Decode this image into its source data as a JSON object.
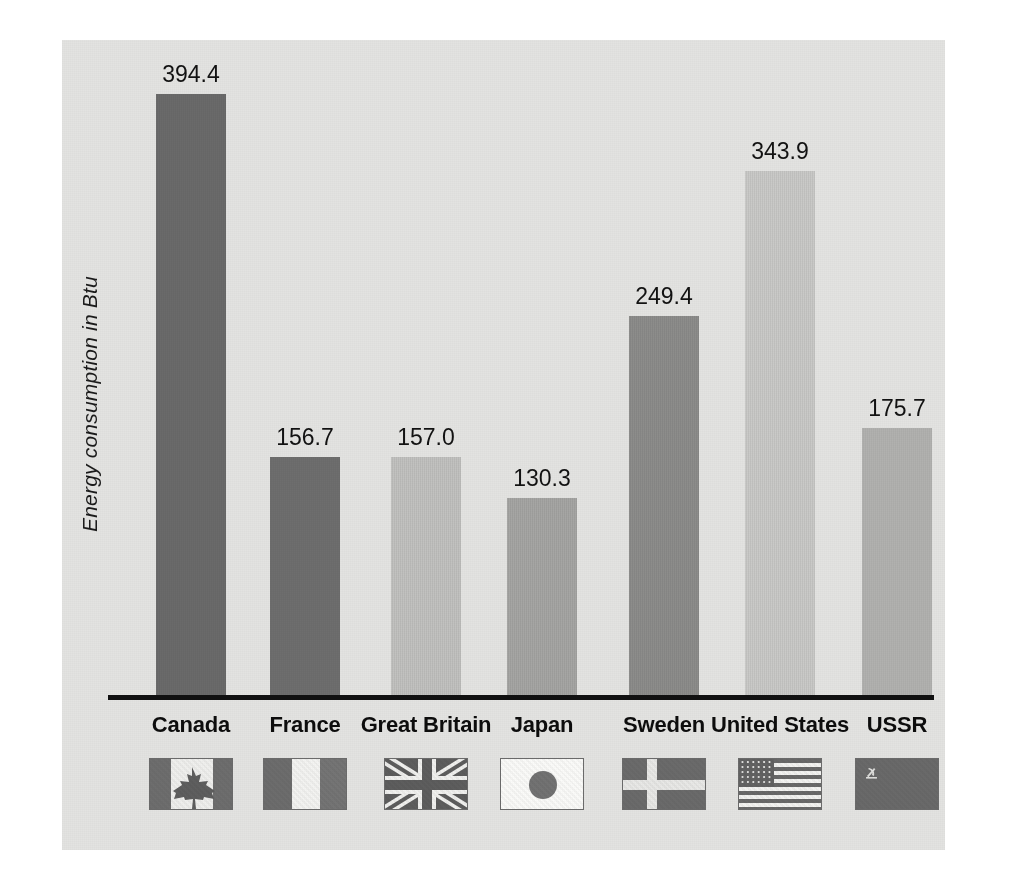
{
  "chart_data": {
    "type": "bar",
    "title": "",
    "xlabel": "",
    "ylabel": "Energy consumption in Btu",
    "ylim": [
      0,
      420
    ],
    "grid": false,
    "legend": "none",
    "categories": [
      "Canada",
      "France",
      "Great Britain",
      "Japan",
      "Sweden",
      "United States",
      "USSR"
    ],
    "values": [
      394.4,
      156.7,
      157.0,
      130.3,
      249.4,
      343.9,
      175.7
    ],
    "value_labels": [
      "394.4",
      "156.7",
      "157.0",
      "130.3",
      "249.4",
      "343.9",
      "175.7"
    ],
    "bar_colors": [
      "#6b6b6b",
      "#6f6f6f",
      "#c2c2c0",
      "#a6a6a4",
      "#8d8d8b",
      "#cacac8",
      "#b3b3b1"
    ],
    "flags": [
      "canada-flag",
      "france-flag",
      "great-britain-flag",
      "japan-flag",
      "sweden-flag",
      "united-states-flag",
      "ussr-flag"
    ]
  },
  "panel": {
    "background_color": "#e3e3e1",
    "axis_color": "#111111"
  },
  "axis": {
    "y_title": "Energy consumption in Btu"
  }
}
